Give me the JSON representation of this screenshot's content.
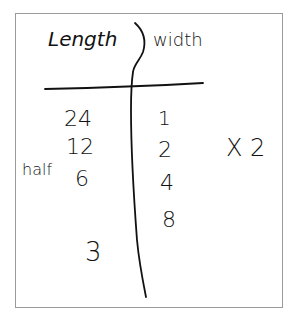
{
  "table": {
    "headers": {
      "left": "Length",
      "right": "width"
    },
    "left_column": [
      "24",
      "12",
      "6",
      "3"
    ],
    "right_column": [
      "1",
      "2",
      "4",
      "8"
    ],
    "left_annotation": "half",
    "right_annotation": "X 2"
  },
  "colors": {
    "ink": "#111111",
    "border": "#9a9a9a",
    "background": "#ffffff"
  }
}
